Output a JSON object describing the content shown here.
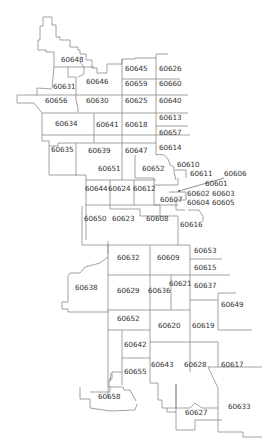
{
  "map": {
    "type": "zip-code-boundary-map",
    "line_color": "#8a8a8a",
    "text_color": "#333333",
    "background": "#ffffff",
    "zip_labels": [
      {
        "zip": "60648",
        "x": 62,
        "y": 60
      },
      {
        "zip": "60646",
        "x": 87,
        "y": 82
      },
      {
        "zip": "60645",
        "x": 126,
        "y": 69
      },
      {
        "zip": "60626",
        "x": 160,
        "y": 69
      },
      {
        "zip": "60631",
        "x": 54,
        "y": 87
      },
      {
        "zip": "60659",
        "x": 126,
        "y": 84
      },
      {
        "zip": "60660",
        "x": 160,
        "y": 84
      },
      {
        "zip": "60656",
        "x": 46,
        "y": 101
      },
      {
        "zip": "60630",
        "x": 87,
        "y": 101
      },
      {
        "zip": "60625",
        "x": 126,
        "y": 101
      },
      {
        "zip": "60640",
        "x": 160,
        "y": 101
      },
      {
        "zip": "60613",
        "x": 160,
        "y": 118
      },
      {
        "zip": "60634",
        "x": 56,
        "y": 124
      },
      {
        "zip": "60641",
        "x": 97,
        "y": 125
      },
      {
        "zip": "60618",
        "x": 126,
        "y": 125
      },
      {
        "zip": "60657",
        "x": 160,
        "y": 133
      },
      {
        "zip": "60614",
        "x": 160,
        "y": 148
      },
      {
        "zip": "60635",
        "x": 52,
        "y": 150
      },
      {
        "zip": "60639",
        "x": 89,
        "y": 151
      },
      {
        "zip": "60647",
        "x": 126,
        "y": 151
      },
      {
        "zip": "60610",
        "x": 178,
        "y": 165
      },
      {
        "zip": "60651",
        "x": 99,
        "y": 169
      },
      {
        "zip": "60652_n",
        "zip_text": "60652",
        "x": 143,
        "y": 169
      },
      {
        "zip": "60611",
        "x": 191,
        "y": 174
      },
      {
        "zip": "60606",
        "x": 225,
        "y": 174
      },
      {
        "zip": "60601",
        "x": 206,
        "y": 184
      },
      {
        "zip": "60644",
        "x": 86,
        "y": 189
      },
      {
        "zip": "60624",
        "x": 109,
        "y": 189
      },
      {
        "zip": "60612",
        "x": 134,
        "y": 189
      },
      {
        "zip": "60602",
        "x": 188,
        "y": 194
      },
      {
        "zip": "60603",
        "x": 213,
        "y": 194
      },
      {
        "zip": "60607",
        "x": 161,
        "y": 200
      },
      {
        "zip": "60604",
        "x": 188,
        "y": 203
      },
      {
        "zip": "60605",
        "x": 213,
        "y": 203
      },
      {
        "zip": "60650",
        "x": 85,
        "y": 219
      },
      {
        "zip": "60623",
        "x": 113,
        "y": 219
      },
      {
        "zip": "60608",
        "x": 147,
        "y": 219
      },
      {
        "zip": "60616",
        "x": 181,
        "y": 225
      },
      {
        "zip": "60653",
        "x": 195,
        "y": 251
      },
      {
        "zip": "60632",
        "x": 118,
        "y": 258
      },
      {
        "zip": "60609",
        "x": 158,
        "y": 258
      },
      {
        "zip": "60615",
        "x": 195,
        "y": 268
      },
      {
        "zip": "60621",
        "x": 170,
        "y": 284
      },
      {
        "zip": "60638",
        "x": 76,
        "y": 288
      },
      {
        "zip": "60629",
        "x": 118,
        "y": 291
      },
      {
        "zip": "60636",
        "x": 149,
        "y": 291
      },
      {
        "zip": "60637",
        "x": 195,
        "y": 286
      },
      {
        "zip": "60649",
        "x": 222,
        "y": 305
      },
      {
        "zip": "60652",
        "x": 118,
        "y": 319
      },
      {
        "zip": "60620",
        "x": 159,
        "y": 326
      },
      {
        "zip": "60619",
        "x": 193,
        "y": 326
      },
      {
        "zip": "60642",
        "x": 125,
        "y": 345
      },
      {
        "zip": "60643",
        "x": 152,
        "y": 365
      },
      {
        "zip": "60628",
        "x": 185,
        "y": 365
      },
      {
        "zip": "60617",
        "x": 222,
        "y": 365
      },
      {
        "zip": "60655",
        "x": 125,
        "y": 372
      },
      {
        "zip": "60658",
        "x": 99,
        "y": 397
      },
      {
        "zip": "60633",
        "x": 229,
        "y": 407
      },
      {
        "zip": "60627",
        "x": 186,
        "y": 413
      }
    ],
    "leader_line": {
      "from_zip": "60606",
      "x1": 224,
      "y1": 178,
      "x2": 179,
      "y2": 191
    }
  }
}
